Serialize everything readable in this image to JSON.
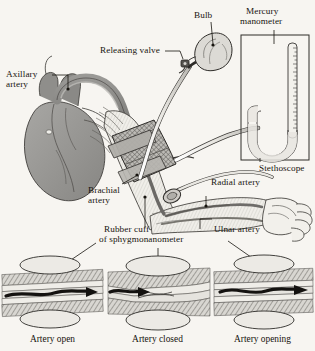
{
  "figure": {
    "background_color": "#f7f5f1",
    "ink_color": "#17140f",
    "width": 315,
    "height": 351
  },
  "labels": {
    "bulb": "Bulb",
    "mercury_manometer_line1": "Mercury",
    "mercury_manometer_line2": "manometer",
    "releasing_valve": "Releasing valve",
    "axillary_artery_line1": "Axillary",
    "axillary_artery_line2": "artery",
    "stethoscope": "Stethoscope",
    "brachial_artery_line1": "Brachial",
    "brachial_artery_line2": "artery",
    "radial_artery": "Radial artery",
    "ulnar_artery": "Ulnar artery",
    "rubber_cuff_line1": "Rubber cuff",
    "rubber_cuff_line2": "of sphygmonanometer"
  },
  "panels": [
    {
      "id": "artery-open",
      "caption": "Artery open",
      "state": "open"
    },
    {
      "id": "artery-closed",
      "caption": "Artery closed",
      "state": "closed"
    },
    {
      "id": "artery-opening",
      "caption": "Artery opening",
      "state": "opening"
    }
  ],
  "colors": {
    "heart_fill": "#9b9a97",
    "vessel_fill": "#7d7c79",
    "tissue_fill": "#c9c7c2",
    "tissue_light": "#e2e0db",
    "cuff_fill": "#b9b7b2",
    "arrow": "#141210",
    "outline": "#2a2724"
  }
}
